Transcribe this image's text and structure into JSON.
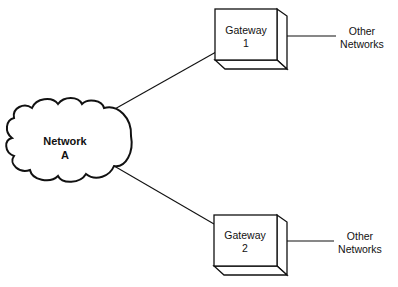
{
  "diagram": {
    "type": "network-topology",
    "colors": {
      "stroke": "#111111",
      "background": "#ffffff",
      "text": "#111111"
    },
    "network": {
      "id": "network-a",
      "shape": "cloud",
      "label_line1": "Network",
      "label_line2": "A"
    },
    "gateways": [
      {
        "id": "gateway-1",
        "shape": "3d-box",
        "label_line1": "Gateway",
        "label_line2": "1",
        "external": {
          "label_line1": "Other",
          "label_line2": "Networks"
        }
      },
      {
        "id": "gateway-2",
        "shape": "3d-box",
        "label_line1": "Gateway",
        "label_line2": "2",
        "external": {
          "label_line1": "Other",
          "label_line2": "Networks"
        }
      }
    ],
    "edges": [
      {
        "from": "network-a",
        "to": "gateway-1"
      },
      {
        "from": "network-a",
        "to": "gateway-2"
      },
      {
        "from": "gateway-1",
        "to": "other-networks-1"
      },
      {
        "from": "gateway-2",
        "to": "other-networks-2"
      }
    ]
  }
}
